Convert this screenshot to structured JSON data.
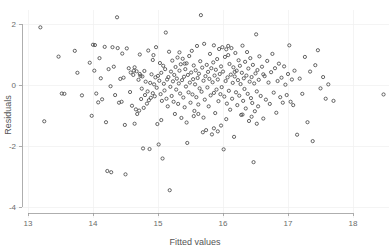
{
  "chart_data": {
    "type": "scatter",
    "title": "",
    "xlabel": "Fitted values",
    "ylabel": "Residuals",
    "xlim": [
      12.78,
      18.55
    ],
    "ylim": [
      -4.35,
      2.45
    ],
    "xticks": [
      13,
      14,
      15,
      16,
      17,
      18
    ],
    "yticks": [
      2,
      0,
      -2,
      -4
    ],
    "xtick_labels": [
      "13",
      "14",
      "15",
      "16",
      "17",
      "18"
    ],
    "ytick_labels": [
      "2",
      "0",
      "-2",
      "-4"
    ],
    "grid": "faint",
    "legend": "none",
    "marker": "open-circle",
    "marker_color": "#4a4a4a",
    "marker_radius_px": 1.6,
    "n_points": 296,
    "points": [
      [
        13.19,
        1.89
      ],
      [
        13.25,
        -1.19
      ],
      [
        13.47,
        0.93
      ],
      [
        13.52,
        -0.28
      ],
      [
        13.56,
        -0.29
      ],
      [
        13.72,
        1.12
      ],
      [
        13.76,
        0.4
      ],
      [
        13.83,
        -0.34
      ],
      [
        13.95,
        0.73
      ],
      [
        13.98,
        -1.01
      ],
      [
        14.0,
        1.32
      ],
      [
        14.02,
        0.47
      ],
      [
        14.03,
        1.31
      ],
      [
        14.05,
        -0.28
      ],
      [
        14.08,
        -0.57
      ],
      [
        14.12,
        0.22
      ],
      [
        14.14,
        -0.47
      ],
      [
        14.18,
        1.25
      ],
      [
        14.2,
        -1.22
      ],
      [
        14.22,
        -2.82
      ],
      [
        14.24,
        0.52
      ],
      [
        14.27,
        -0.04
      ],
      [
        14.28,
        -2.86
      ],
      [
        14.3,
        1.24
      ],
      [
        14.32,
        0.6
      ],
      [
        14.34,
        -0.33
      ],
      [
        14.37,
        2.22
      ],
      [
        14.38,
        1.21
      ],
      [
        14.4,
        -0.58
      ],
      [
        14.42,
        0.2
      ],
      [
        14.44,
        -0.55
      ],
      [
        14.47,
        0.24
      ],
      [
        14.49,
        -1.31
      ],
      [
        14.5,
        -2.93
      ],
      [
        14.52,
        1.2
      ],
      [
        14.55,
        0.55
      ],
      [
        14.57,
        -0.23
      ],
      [
        14.58,
        0.41
      ],
      [
        14.6,
        -0.68
      ],
      [
        14.62,
        0.33
      ],
      [
        14.63,
        0.47
      ],
      [
        14.64,
        0.58
      ],
      [
        14.66,
        -0.8
      ],
      [
        14.67,
        0.45
      ],
      [
        14.68,
        -0.95
      ],
      [
        14.7,
        0.17
      ],
      [
        14.71,
        -0.84
      ],
      [
        14.72,
        0.36
      ],
      [
        14.73,
        0.3
      ],
      [
        14.74,
        -0.46
      ],
      [
        14.75,
        -0.12
      ],
      [
        14.76,
        0.28
      ],
      [
        14.77,
        -2.08
      ],
      [
        14.78,
        -0.75
      ],
      [
        14.79,
        0.46
      ],
      [
        14.8,
        -0.33
      ],
      [
        14.81,
        0.11
      ],
      [
        14.83,
        -0.61
      ],
      [
        14.84,
        -0.21
      ],
      [
        14.85,
        1.13
      ],
      [
        14.86,
        -0.5
      ],
      [
        14.87,
        -2.1
      ],
      [
        14.88,
        0.07
      ],
      [
        14.89,
        -0.42
      ],
      [
        14.9,
        0.35
      ],
      [
        14.92,
        -0.27
      ],
      [
        14.93,
        0.98
      ],
      [
        14.94,
        0.02
      ],
      [
        14.95,
        -0.37
      ],
      [
        14.96,
        0.25
      ],
      [
        14.97,
        1.24
      ],
      [
        14.98,
        -0.09
      ],
      [
        14.99,
        -1.28
      ],
      [
        15.0,
        0.3
      ],
      [
        15.01,
        -1.95
      ],
      [
        15.02,
        0.14
      ],
      [
        15.03,
        0.72
      ],
      [
        15.04,
        -0.3
      ],
      [
        15.05,
        0.4
      ],
      [
        15.06,
        -0.52
      ],
      [
        15.07,
        -2.41
      ],
      [
        15.08,
        0.63
      ],
      [
        15.09,
        0.04
      ],
      [
        15.1,
        -0.18
      ],
      [
        15.11,
        0.52
      ],
      [
        15.12,
        1.72
      ],
      [
        15.13,
        -0.45
      ],
      [
        15.14,
        0.18
      ],
      [
        15.15,
        -0.7
      ],
      [
        15.16,
        0.26
      ],
      [
        15.17,
        1.09
      ],
      [
        15.18,
        -3.45
      ],
      [
        15.19,
        -0.06
      ],
      [
        15.2,
        0.44
      ],
      [
        15.21,
        -0.36
      ],
      [
        15.22,
        0.8
      ],
      [
        15.23,
        0.12
      ],
      [
        15.24,
        -0.55
      ],
      [
        15.25,
        0.33
      ],
      [
        15.26,
        -0.95
      ],
      [
        15.27,
        0.59
      ],
      [
        15.28,
        -0.15
      ],
      [
        15.29,
        0.21
      ],
      [
        15.3,
        0.9
      ],
      [
        15.31,
        -0.62
      ],
      [
        15.32,
        0.05
      ],
      [
        15.33,
        0.47
      ],
      [
        15.34,
        -0.28
      ],
      [
        15.35,
        0.68
      ],
      [
        15.36,
        -1.08
      ],
      [
        15.37,
        0.16
      ],
      [
        15.38,
        0.86
      ],
      [
        15.39,
        -0.41
      ],
      [
        15.4,
        0.27
      ],
      [
        15.41,
        -0.73
      ],
      [
        15.42,
        0.52
      ],
      [
        15.43,
        -0.05
      ],
      [
        15.44,
        0.71
      ],
      [
        15.45,
        -1.9
      ],
      [
        15.46,
        0.33
      ],
      [
        15.47,
        -0.24
      ],
      [
        15.48,
        0.95
      ],
      [
        15.49,
        0.08
      ],
      [
        15.5,
        -0.58
      ],
      [
        15.51,
        0.41
      ],
      [
        15.52,
        1.12
      ],
      [
        15.53,
        -0.31
      ],
      [
        15.54,
        0.19
      ],
      [
        15.55,
        0.64
      ],
      [
        15.56,
        -0.85
      ],
      [
        15.57,
        0.02
      ],
      [
        15.58,
        0.48
      ],
      [
        15.59,
        -0.4
      ],
      [
        15.6,
        1.28
      ],
      [
        15.61,
        0.23
      ],
      [
        15.62,
        -0.64
      ],
      [
        15.63,
        0.37
      ],
      [
        15.64,
        -0.11
      ],
      [
        15.65,
        0.78
      ],
      [
        15.66,
        2.29
      ],
      [
        15.67,
        -0.22
      ],
      [
        15.68,
        0.57
      ],
      [
        15.69,
        -1.55
      ],
      [
        15.7,
        0.14
      ],
      [
        15.71,
        1.35
      ],
      [
        15.72,
        -0.48
      ],
      [
        15.73,
        0.29
      ],
      [
        15.74,
        -1.48
      ],
      [
        15.75,
        0.66
      ],
      [
        15.76,
        -0.08
      ],
      [
        15.77,
        0.43
      ],
      [
        15.78,
        -0.7
      ],
      [
        15.79,
        0.2
      ],
      [
        15.8,
        1.02
      ],
      [
        15.81,
        -0.34
      ],
      [
        15.82,
        0.55
      ],
      [
        15.83,
        -1.62
      ],
      [
        15.84,
        0.09
      ],
      [
        15.85,
        0.74
      ],
      [
        15.86,
        -0.26
      ],
      [
        15.87,
        0.31
      ],
      [
        15.88,
        -0.92
      ],
      [
        15.89,
        0.5
      ],
      [
        15.9,
        -0.15
      ],
      [
        15.91,
        0.85
      ],
      [
        15.92,
        0.18
      ],
      [
        15.93,
        -0.53
      ],
      [
        15.94,
        1.18
      ],
      [
        15.95,
        0.36
      ],
      [
        15.96,
        -0.3
      ],
      [
        15.97,
        0.61
      ],
      [
        15.98,
        -0.07
      ],
      [
        15.99,
        1.24
      ],
      [
        16.0,
        0.44
      ],
      [
        16.01,
        -2.11
      ],
      [
        16.02,
        -0.38
      ],
      [
        16.03,
        0.92
      ],
      [
        16.04,
        0.13
      ],
      [
        16.05,
        1.17
      ],
      [
        16.06,
        -0.61
      ],
      [
        16.07,
        0.25
      ],
      [
        16.08,
        0.98
      ],
      [
        16.09,
        -0.19
      ],
      [
        16.1,
        0.69
      ],
      [
        16.11,
        -0.81
      ],
      [
        16.12,
        0.34
      ],
      [
        16.13,
        1.21
      ],
      [
        16.14,
        -0.45
      ],
      [
        16.15,
        0.07
      ],
      [
        16.16,
        0.58
      ],
      [
        16.17,
        -1.7
      ],
      [
        16.18,
        0.28
      ],
      [
        16.19,
        1.05
      ],
      [
        16.2,
        -0.24
      ],
      [
        16.21,
        0.47
      ],
      [
        16.22,
        -0.66
      ],
      [
        16.23,
        0.16
      ],
      [
        16.24,
        0.81
      ],
      [
        16.25,
        -0.35
      ],
      [
        16.26,
        0.63
      ],
      [
        16.27,
        0.03
      ],
      [
        16.28,
        -0.98
      ],
      [
        16.29,
        0.4
      ],
      [
        16.3,
        1.29
      ],
      [
        16.31,
        -0.52
      ],
      [
        16.32,
        0.22
      ],
      [
        16.33,
        -0.13
      ],
      [
        16.34,
        0.76
      ],
      [
        16.35,
        -0.77
      ],
      [
        16.36,
        0.31
      ],
      [
        16.37,
        1.08
      ],
      [
        16.38,
        -0.29
      ],
      [
        16.39,
        0.54
      ],
      [
        16.4,
        -1.18
      ],
      [
        16.41,
        0.11
      ],
      [
        16.42,
        0.88
      ],
      [
        16.43,
        -0.43
      ],
      [
        16.44,
        0.26
      ],
      [
        16.45,
        -0.59
      ],
      [
        16.46,
        0.66
      ],
      [
        16.47,
        -2.53
      ],
      [
        16.48,
        0.05
      ],
      [
        16.49,
        -0.86
      ],
      [
        16.5,
        0.38
      ],
      [
        16.51,
        1.66
      ],
      [
        16.52,
        -0.21
      ],
      [
        16.53,
        0.49
      ],
      [
        16.54,
        -0.7
      ],
      [
        16.55,
        0.17
      ],
      [
        16.56,
        0.94
      ],
      [
        16.58,
        -0.36
      ],
      [
        16.6,
        0.6
      ],
      [
        16.62,
        -1.1
      ],
      [
        16.64,
        0.29
      ],
      [
        16.66,
        -0.48
      ],
      [
        16.68,
        0.79
      ],
      [
        16.7,
        0.08
      ],
      [
        16.72,
        -0.62
      ],
      [
        16.74,
        0.42
      ],
      [
        16.76,
        1.02
      ],
      [
        16.78,
        -0.25
      ],
      [
        16.8,
        0.55
      ],
      [
        16.82,
        -0.91
      ],
      [
        16.84,
        0.13
      ],
      [
        16.86,
        0.7
      ],
      [
        16.88,
        -0.4
      ],
      [
        16.9,
        0.24
      ],
      [
        16.92,
        -0.58
      ],
      [
        16.94,
        0.61
      ],
      [
        16.96,
        0.01
      ],
      [
        16.98,
        -0.33
      ],
      [
        17.0,
        0.36
      ],
      [
        17.02,
        1.3
      ],
      [
        17.04,
        -0.55
      ],
      [
        17.06,
        0.18
      ],
      [
        17.08,
        -0.66
      ],
      [
        17.1,
        0.47
      ],
      [
        17.14,
        -1.63
      ],
      [
        17.18,
        0.21
      ],
      [
        17.22,
        -0.29
      ],
      [
        17.26,
        0.92
      ],
      [
        17.3,
        -1.22
      ],
      [
        17.34,
        0.44
      ],
      [
        17.38,
        -1.84
      ],
      [
        17.42,
        0.65
      ],
      [
        17.46,
        1.14
      ],
      [
        17.5,
        -0.11
      ],
      [
        17.54,
        0.26
      ],
      [
        17.58,
        -0.45
      ],
      [
        17.62,
        0.02
      ],
      [
        17.7,
        -0.52
      ],
      [
        18.47,
        -0.31
      ],
      [
        14.1,
        0.88
      ],
      [
        14.45,
        1.03
      ],
      [
        14.92,
        0.82
      ],
      [
        15.44,
        -1.23
      ],
      [
        15.55,
        -1.02
      ],
      [
        15.62,
        -0.95
      ],
      [
        15.7,
        -1.07
      ],
      [
        16.05,
        -1.12
      ],
      [
        16.3,
        -0.97
      ],
      [
        16.44,
        -1.04
      ],
      [
        15.05,
        -1.15
      ],
      [
        15.86,
        1.3
      ],
      [
        16.08,
        1.28
      ],
      [
        15.33,
        1.07
      ],
      [
        14.72,
        1.0
      ],
      [
        15.97,
        -1.33
      ],
      [
        16.62,
        0.35
      ],
      [
        14.64,
        -1.27
      ],
      [
        15.86,
        -1.42
      ],
      [
        15.92,
        -1.52
      ],
      [
        16.18,
        0.43
      ],
      [
        15.41,
        0.7
      ],
      [
        16.52,
        -1.27
      ]
    ]
  },
  "axes": {
    "x_axis_name": "x-axis",
    "y_axis_name": "y-axis"
  }
}
